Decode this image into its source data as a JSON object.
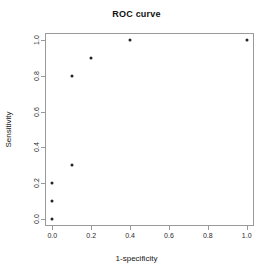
{
  "chart_data": {
    "type": "scatter",
    "title": "ROC curve",
    "xlabel": "1-specificity",
    "ylabel": "Sensitivity",
    "xlim": [
      0,
      1
    ],
    "ylim": [
      0,
      1
    ],
    "grid": false,
    "legend": null,
    "xticks": [
      {
        "value": 0.0,
        "label": "0.0"
      },
      {
        "value": 0.2,
        "label": "0.2"
      },
      {
        "value": 0.4,
        "label": "0.4"
      },
      {
        "value": 0.6,
        "label": "0.6"
      },
      {
        "value": 0.8,
        "label": "0.8"
      },
      {
        "value": 1.0,
        "label": "1.0"
      }
    ],
    "yticks": [
      {
        "value": 0.0,
        "label": "0.0"
      },
      {
        "value": 0.2,
        "label": "0.2"
      },
      {
        "value": 0.4,
        "label": "0.4"
      },
      {
        "value": 0.6,
        "label": "0.6"
      },
      {
        "value": 0.8,
        "label": "0.8"
      },
      {
        "value": 1.0,
        "label": "1.0"
      }
    ],
    "series": [
      {
        "name": "ROC points",
        "marker": "filled-circle",
        "color": "#232323",
        "x": [
          0.0,
          0.0,
          0.0,
          0.1,
          0.1,
          0.2,
          0.4,
          1.0
        ],
        "y": [
          0.0,
          0.1,
          0.2,
          0.3,
          0.8,
          0.9,
          1.0,
          1.0
        ]
      }
    ]
  },
  "style": {
    "background": "#ffffff",
    "axis_color": "#9a9a9a",
    "text_color": "#151515",
    "point_color": "#232323"
  }
}
